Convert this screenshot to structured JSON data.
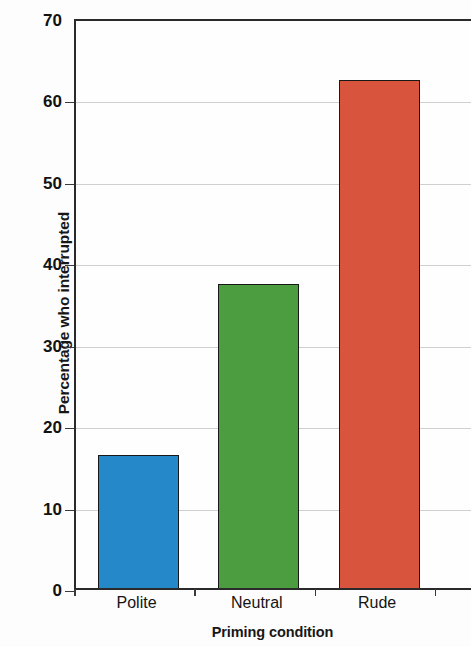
{
  "chart_data": {
    "type": "bar",
    "title": "",
    "categories": [
      "Polite",
      "Neutral",
      "Rude"
    ],
    "values": [
      16.5,
      37.5,
      62.5
    ],
    "series": [
      {
        "name": "Percentage who interrupted",
        "values": [
          16.5,
          37.5,
          62.5
        ]
      }
    ],
    "xlabel": "Priming condition",
    "ylabel": "Percentage who interrupted",
    "ylim": [
      0,
      70
    ],
    "ytick_labels": [
      "0",
      "10",
      "20",
      "30",
      "40",
      "50",
      "60",
      "70"
    ],
    "ytick_values": [
      0,
      10,
      20,
      30,
      40,
      50,
      60,
      70
    ],
    "grid": true,
    "legend": "none",
    "bar_colors": [
      "#2589c9",
      "#4c9c40",
      "#d9543c"
    ],
    "bar_edge_color": "#181818",
    "axis_color": "#2a2a2a",
    "grid_color": "#cfcfcf",
    "background_color": "#fdfdfd"
  }
}
